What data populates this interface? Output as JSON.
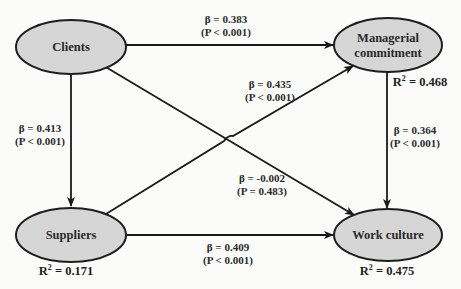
{
  "diagram": {
    "type": "structural-equation-path-model",
    "colors": {
      "node_fill": "#d6d6d6",
      "node_stroke": "#1e1e1e",
      "edge": "#1a1a1a",
      "text": "#2a2a2a",
      "background": "#fbfbfa"
    },
    "nodes": {
      "clients": {
        "label": "Clients"
      },
      "managerial": {
        "label_line1": "Managerial",
        "label_line2": "commitment",
        "r2_prefix": "R",
        "r2_sup": "2",
        "r2_value": " = 0.468"
      },
      "suppliers": {
        "label": "Suppliers",
        "r2_prefix": "R",
        "r2_sup": "2",
        "r2_value": " = 0.171"
      },
      "work_culture": {
        "label": "Work culture",
        "r2_prefix": "R",
        "r2_sup": "2",
        "r2_value": " = 0.475"
      }
    },
    "edges": {
      "clients_to_managerial": {
        "from": "Clients",
        "to": "Managerial commitment",
        "beta": "β = 0.383",
        "p": "(P < 0.001)"
      },
      "clients_to_suppliers": {
        "from": "Clients",
        "to": "Suppliers",
        "beta": "β = 0.413",
        "p": "(P < 0.001)"
      },
      "suppliers_to_managerial": {
        "from": "Suppliers",
        "to": "Managerial commitment",
        "beta": "β = 0.435",
        "p": "(P < 0.001)"
      },
      "clients_to_work_culture": {
        "from": "Clients",
        "to": "Work culture",
        "beta": "β = -0.002",
        "p": "(P = 0.483)"
      },
      "managerial_to_work_culture": {
        "from": "Managerial commitment",
        "to": "Work culture",
        "beta": "β = 0.364",
        "p": "(P < 0.001)"
      },
      "suppliers_to_work_culture": {
        "from": "Suppliers",
        "to": "Work culture",
        "beta": "β = 0.409",
        "p": "(P < 0.001)"
      }
    }
  }
}
